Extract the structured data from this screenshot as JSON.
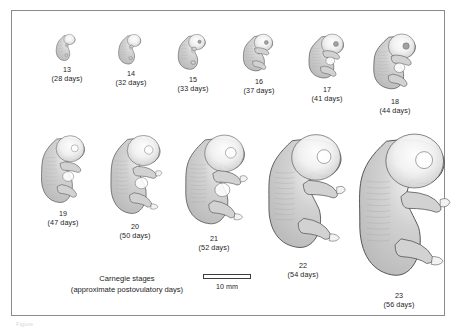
{
  "figure": {
    "caption_line1": "Carnegie stages",
    "caption_line2": "(approximate postovulatory days)",
    "frame_color": "#8a8a8f",
    "background_color": "#ffffff",
    "text_color": "#1d1d1d"
  },
  "scale": {
    "label": "10 mm",
    "bar_length_px": 48,
    "bar_fill": "#fdfdfd",
    "bar_outline": "#3c3c3c"
  },
  "artwork": {
    "body_fill": "#bcbcbc",
    "body_fill_light": "#d2d2d2",
    "highlight_fill": "#f2f2f2",
    "outline": "#4c4c4c",
    "detail": "#9a9a9a"
  },
  "below_frame_text": "Figure",
  "chart_data": {
    "type": "diagram",
    "title": "Carnegie stages",
    "subtitle": "(approximate postovulatory days)",
    "scale_bar": "10 mm",
    "categories": [
      "13",
      "14",
      "15",
      "16",
      "17",
      "18",
      "19",
      "20",
      "21",
      "22",
      "23"
    ],
    "values": [
      28,
      32,
      33,
      37,
      41,
      44,
      47,
      50,
      52,
      54,
      56
    ],
    "xlabel": "Carnegie stage",
    "ylabel": "Postovulatory days"
  },
  "specimens": [
    {
      "stage": "13",
      "days": "(28 days)",
      "row": "top",
      "left": 26,
      "top": 22,
      "art_w": 30,
      "art_h": 30,
      "label_top": 54,
      "scale": 0.3
    },
    {
      "stage": "14",
      "days": "(32 days)",
      "row": "top",
      "left": 90,
      "top": 22,
      "art_w": 34,
      "art_h": 34,
      "label_top": 58,
      "scale": 0.34
    },
    {
      "stage": "15",
      "days": "(33 days)",
      "row": "top",
      "left": 152,
      "top": 22,
      "art_w": 40,
      "art_h": 40,
      "label_top": 64,
      "scale": 0.4
    },
    {
      "stage": "16",
      "days": "(37 days)",
      "row": "top",
      "left": 218,
      "top": 22,
      "art_w": 42,
      "art_h": 42,
      "label_top": 66,
      "scale": 0.42
    },
    {
      "stage": "17",
      "days": "(41 days)",
      "row": "top",
      "left": 286,
      "top": 22,
      "art_w": 48,
      "art_h": 50,
      "label_top": 74,
      "scale": 0.5
    },
    {
      "stage": "18",
      "days": "(44 days)",
      "row": "top",
      "left": 354,
      "top": 22,
      "art_w": 56,
      "art_h": 62,
      "label_top": 86,
      "scale": 0.62
    },
    {
      "stage": "19",
      "days": "(47 days)",
      "row": "bottom",
      "left": 22,
      "top": 124,
      "art_w": 56,
      "art_h": 74,
      "label_top": 198,
      "scale": 0.72
    },
    {
      "stage": "20",
      "days": "(50 days)",
      "row": "bottom",
      "left": 92,
      "top": 124,
      "art_w": 62,
      "art_h": 86,
      "label_top": 211,
      "scale": 0.84
    },
    {
      "stage": "21",
      "days": "(52 days)",
      "row": "bottom",
      "left": 166,
      "top": 124,
      "art_w": 72,
      "art_h": 98,
      "label_top": 223,
      "scale": 0.96
    },
    {
      "stage": "22",
      "days": "(54 days)",
      "row": "bottom",
      "left": 248,
      "top": 124,
      "art_w": 86,
      "art_h": 124,
      "label_top": 250,
      "scale": 1.22
    },
    {
      "stage": "23",
      "days": "(56 days)",
      "row": "bottom",
      "left": 338,
      "top": 124,
      "art_w": 98,
      "art_h": 154,
      "label_top": 280,
      "scale": 1.5
    }
  ]
}
